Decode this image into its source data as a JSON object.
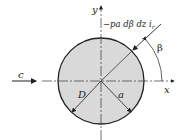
{
  "diagram": {
    "labels": {
      "y_axis": "y",
      "x_axis": "x",
      "flow": "c",
      "force": "−pa dβ dz i",
      "force_sub": "r",
      "angle": "β",
      "diameter": "D",
      "radius": "a"
    },
    "colors": {
      "circle_fill": "#d9d9d9",
      "stroke": "#222222"
    }
  }
}
